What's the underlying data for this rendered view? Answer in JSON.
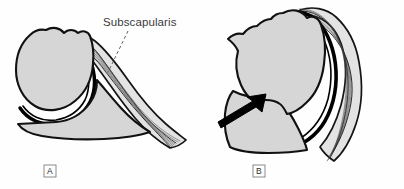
{
  "figure": {
    "background_color": "#fefefe",
    "bone_fill_color": "#d6d6d6",
    "outline_color": "#111111",
    "muscle_fill_color": "#e3e3e3",
    "fiber_color": "#4a4a4a",
    "arrow_color": "#000000"
  },
  "annotations": {
    "muscle_label": "Subscapularis",
    "leader_line": "dashed-leader-line",
    "arrow": "displacement-arrow"
  },
  "panels": [
    {
      "id": "A",
      "letter": "A",
      "structures": [
        "humeral-head",
        "glenoid-scapula",
        "joint-capsule",
        "subscapularis-muscle"
      ]
    },
    {
      "id": "B",
      "letter": "B",
      "structures": [
        "humeral-head",
        "glenoid-scapula",
        "joint-capsule",
        "subscapularis-muscle",
        "displacement-arrow"
      ]
    }
  ]
}
